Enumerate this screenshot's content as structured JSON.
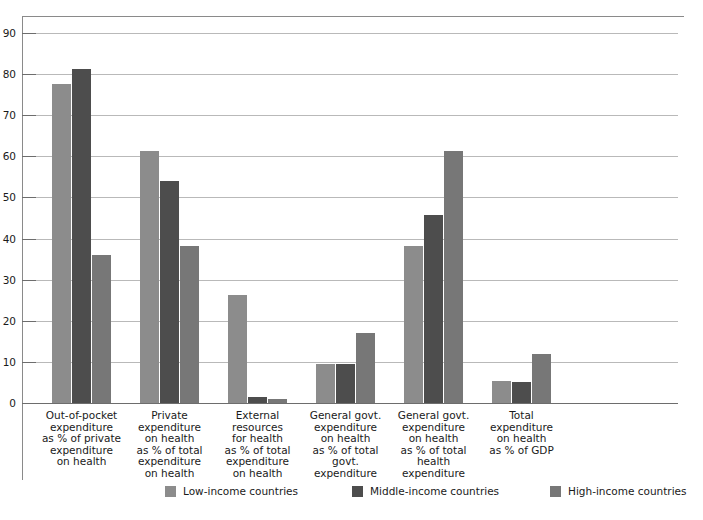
{
  "chart_data": {
    "type": "bar",
    "title": "",
    "subtitle": "",
    "xlabel": "",
    "ylabel": "",
    "ylim": [
      0,
      90
    ],
    "ytick_step": 10,
    "yticks": [
      0,
      10,
      20,
      30,
      40,
      50,
      60,
      70,
      80,
      90
    ],
    "grid": true,
    "legend_position": "bottom",
    "categories": [
      "Out-of-pocket expenditure as % of private expenditure on health",
      "Private expenditure on health as % of total expenditure on health",
      "External resources for health as % of total expenditure on health",
      "General govt. expenditure on health as % of total govt. expenditure",
      "General govt. expenditure on health as % of total health expenditure",
      "Total expenditure on health as % of GDP"
    ],
    "category_lines": [
      [
        "Out-of-pocket",
        "expenditure",
        "as % of private",
        "expenditure",
        "on health"
      ],
      [
        "Private",
        "expenditure",
        "on health",
        "as % of total",
        "expenditure",
        "on health"
      ],
      [
        "External",
        "resources",
        "for health",
        "as % of total",
        "expenditure",
        "on health"
      ],
      [
        "General govt.",
        "expenditure",
        "on health",
        "as % of total",
        "govt.",
        "expenditure"
      ],
      [
        "General govt.",
        "expenditure",
        "on health",
        "as % of total",
        "health",
        "expenditure"
      ],
      [
        "Total",
        "expenditure",
        "on health",
        "as % of GDP"
      ]
    ],
    "series": [
      {
        "name": "Low-income countries",
        "color": "#8c8c8c",
        "values": [
          77.5,
          61.4,
          26.2,
          9.4,
          38.3,
          5.4
        ]
      },
      {
        "name": "Middle-income countries",
        "color": "#4d4d4d",
        "values": [
          81.3,
          54.0,
          1.5,
          9.4,
          45.7,
          5.0
        ]
      },
      {
        "name": "High-income countries",
        "color": "#777777",
        "values": [
          36.0,
          38.1,
          1.0,
          17.0,
          61.4,
          12.0
        ]
      }
    ]
  },
  "legend": {
    "items": [
      {
        "label": "Low-income countries",
        "color": "#8c8c8c"
      },
      {
        "label": "Middle-income countries",
        "color": "#4d4d4d"
      },
      {
        "label": "High-income countries",
        "color": "#777777"
      }
    ]
  },
  "axis": {
    "grid_color": "#b9b9b9",
    "axis_color": "#6d6d6d",
    "frame_color": "#8a8a8a"
  }
}
